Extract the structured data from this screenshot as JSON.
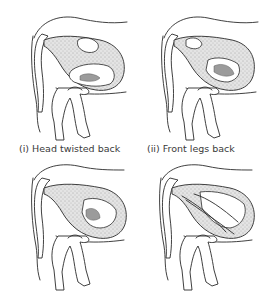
{
  "figure": {
    "panels": [
      {
        "id": "i",
        "caption": "(i) Head twisted back",
        "presentation": "head-twisted-back"
      },
      {
        "id": "ii",
        "caption": "(ii) Front legs back",
        "presentation": "front-legs-back"
      },
      {
        "id": "iii",
        "caption": "",
        "presentation": "breech"
      },
      {
        "id": "iv",
        "caption": "",
        "presentation": "uterine-torsion"
      }
    ]
  }
}
